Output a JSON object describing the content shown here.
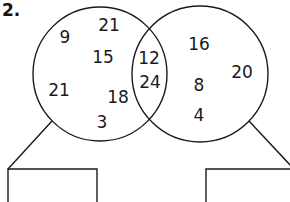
{
  "question": {
    "label": "2."
  },
  "diagram": {
    "type": "venn",
    "stroke_color": "#1a1a1a",
    "left_circle": {
      "cx": 100,
      "cy": 74,
      "r": 67,
      "numbers": [
        {
          "value": "9",
          "x": 65,
          "y": 38
        },
        {
          "value": "21",
          "x": 109,
          "y": 26
        },
        {
          "value": "15",
          "x": 103,
          "y": 58
        },
        {
          "value": "21",
          "x": 59,
          "y": 91
        },
        {
          "value": "18",
          "x": 118,
          "y": 98
        },
        {
          "value": "3",
          "x": 102,
          "y": 123
        }
      ]
    },
    "intersection": {
      "numbers": [
        {
          "value": "12",
          "x": 149,
          "y": 59
        },
        {
          "value": "24",
          "x": 150,
          "y": 83
        }
      ]
    },
    "right_circle": {
      "cx": 200,
      "cy": 74,
      "r": 68,
      "numbers": [
        {
          "value": "16",
          "x": 199,
          "y": 45
        },
        {
          "value": "20",
          "x": 242,
          "y": 73
        },
        {
          "value": "8",
          "x": 199,
          "y": 86
        },
        {
          "value": "4",
          "x": 199,
          "y": 116
        }
      ]
    },
    "answer_boxes": [
      {
        "name": "left-answer-box",
        "x": 8,
        "y": 169,
        "width": 89,
        "height": 40
      },
      {
        "name": "right-answer-box",
        "x": 206,
        "y": 169,
        "width": 90,
        "height": 40
      }
    ]
  }
}
